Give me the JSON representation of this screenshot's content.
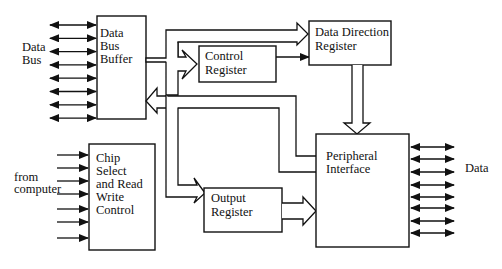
{
  "diagram": {
    "blocks": {
      "data_bus_buffer": [
        "Data",
        "Bus",
        "Buffer"
      ],
      "control_register": [
        "Control",
        "Register"
      ],
      "data_direction_register": [
        "Data Direction",
        "Register"
      ],
      "chip_select": [
        "Chip",
        "Select",
        "and Read",
        "Write",
        "Control"
      ],
      "output_register": [
        "Output",
        "Register"
      ],
      "peripheral_interface": [
        "Peripheral",
        "Interface"
      ]
    },
    "labels": {
      "data_bus": [
        "Data",
        "Bus"
      ],
      "from_computer": [
        "from",
        "computer"
      ],
      "data_out": "Data"
    },
    "line_counts": {
      "data_bus_lines": 8,
      "computer_control_lines": 7,
      "peripheral_data_lines": 8
    }
  }
}
